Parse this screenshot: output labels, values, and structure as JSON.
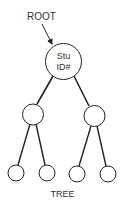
{
  "diagram": {
    "caption": "TREE",
    "pointer_label": "ROOT",
    "root": {
      "line1": "Stu",
      "line2": "ID#"
    },
    "colors": {
      "stroke": "#222222",
      "text": "#333333",
      "background": "#ffffff"
    },
    "structure": {
      "type": "binary-tree",
      "levels": 3,
      "nodes": [
        {
          "id": "root",
          "label": "Stu ID#",
          "children": [
            "left",
            "right"
          ]
        },
        {
          "id": "left",
          "label": "",
          "children": [
            "left-left",
            "left-right"
          ]
        },
        {
          "id": "right",
          "label": "",
          "children": [
            "right-left",
            "right-right"
          ]
        },
        {
          "id": "left-left",
          "label": "",
          "children": []
        },
        {
          "id": "left-right",
          "label": "",
          "children": []
        },
        {
          "id": "right-left",
          "label": "",
          "children": []
        },
        {
          "id": "right-right",
          "label": "",
          "children": []
        }
      ]
    }
  }
}
